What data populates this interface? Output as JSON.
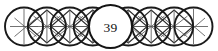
{
  "figure": {
    "kind": "overlapping-circle-chain",
    "center_label": "39",
    "circle_count": 9,
    "canvas": {
      "width": 218,
      "height": 51
    },
    "colors": {
      "background": "#ffffff",
      "outline": "#1a1a1a",
      "lattice": "#5a5a5a",
      "label_text": "#111111",
      "label_fill": "#ffffff"
    },
    "geometry": {
      "center_y": 26.5,
      "radius": 19.0,
      "spacing": 22.9,
      "first_center_x": 24.0,
      "labelled_index": 4
    },
    "circles": [
      {
        "index": 0,
        "cx": 24.0,
        "cy": 26.5,
        "r": 19.0,
        "lattice": "partial",
        "labelled": false
      },
      {
        "index": 1,
        "cx": 46.9,
        "cy": 26.5,
        "r": 19.0,
        "lattice": "full",
        "labelled": false
      },
      {
        "index": 2,
        "cx": 69.8,
        "cy": 26.5,
        "r": 19.0,
        "lattice": "full",
        "labelled": false
      },
      {
        "index": 3,
        "cx": 92.7,
        "cy": 26.5,
        "r": 19.0,
        "lattice": "full",
        "labelled": false
      },
      {
        "index": 4,
        "cx": 110.5,
        "cy": 26.5,
        "r": 22.0,
        "lattice": "none",
        "labelled": true
      },
      {
        "index": 5,
        "cx": 128.3,
        "cy": 26.5,
        "r": 19.0,
        "lattice": "full",
        "labelled": false
      },
      {
        "index": 6,
        "cx": 151.2,
        "cy": 26.5,
        "r": 19.0,
        "lattice": "full",
        "labelled": false
      },
      {
        "index": 7,
        "cx": 174.1,
        "cy": 26.5,
        "r": 19.0,
        "lattice": "full",
        "labelled": false
      },
      {
        "index": 8,
        "cx": 193.5,
        "cy": 26.5,
        "r": 19.0,
        "lattice": "partial",
        "labelled": false
      }
    ],
    "lattice_segments": [
      {
        "x1": 10.0,
        "y1": 26.5,
        "x2": 38.5,
        "y2": 26.5
      },
      {
        "x1": 33.0,
        "y1": 26.5,
        "x2": 61.0,
        "y2": 26.5
      },
      {
        "x1": 56.0,
        "y1": 26.5,
        "x2": 84.0,
        "y2": 26.5
      },
      {
        "x1": 79.0,
        "y1": 26.5,
        "x2": 107.0,
        "y2": 26.5
      },
      {
        "x1": 114.0,
        "y1": 26.5,
        "x2": 142.0,
        "y2": 26.5
      },
      {
        "x1": 137.0,
        "y1": 26.5,
        "x2": 165.0,
        "y2": 26.5
      },
      {
        "x1": 160.0,
        "y1": 26.5,
        "x2": 188.0,
        "y2": 26.5
      },
      {
        "x1": 180.0,
        "y1": 26.5,
        "x2": 208.0,
        "y2": 26.5
      }
    ]
  }
}
